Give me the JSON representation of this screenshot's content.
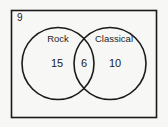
{
  "diagram": {
    "type": "venn",
    "universe_outside_count": "9",
    "sets": [
      {
        "label": "Rock",
        "only_count": "15"
      },
      {
        "label": "Classical",
        "only_count": "10"
      }
    ],
    "intersection_count": "6",
    "colors": {
      "stroke": "#1a1a1a",
      "background": "#f7f7f5",
      "text": "#222222"
    }
  }
}
